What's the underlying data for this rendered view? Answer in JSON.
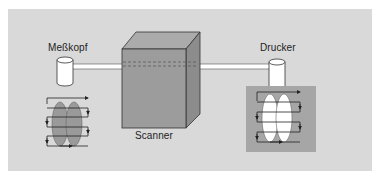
{
  "diagram": {
    "labels": {
      "probe": "Meßkopf",
      "printer": "Drucker",
      "scanner": "Scanner"
    },
    "colors": {
      "background": "#ffffff",
      "panel": "#d9d9d9",
      "scanner_front": "#9c9c9c",
      "scanner_top": "#aaaaaa",
      "scanner_side": "#8a8a8a",
      "rod": "#ffffff",
      "output_box": "#a6a6a6",
      "probe_ellipse": "#9a9a9a",
      "printer_ellipse": "#ffffff",
      "line": "#222222"
    },
    "components": [
      {
        "id": "probe",
        "type": "cylinder",
        "label": "Meßkopf"
      },
      {
        "id": "scanner",
        "type": "box",
        "label": "Scanner"
      },
      {
        "id": "printer",
        "type": "cylinder",
        "label": "Drucker"
      }
    ],
    "connections": [
      {
        "from": "probe",
        "to": "scanner",
        "type": "rod"
      },
      {
        "from": "scanner",
        "to": "printer",
        "type": "rod"
      }
    ],
    "scan_patterns": [
      {
        "id": "probe-scan",
        "position": "below-probe",
        "ellipse_fill": "gray",
        "rows": 4
      },
      {
        "id": "printer-scan",
        "position": "below-printer",
        "ellipse_fill": "white",
        "rows": 4,
        "background": "dark-gray-box"
      }
    ]
  }
}
